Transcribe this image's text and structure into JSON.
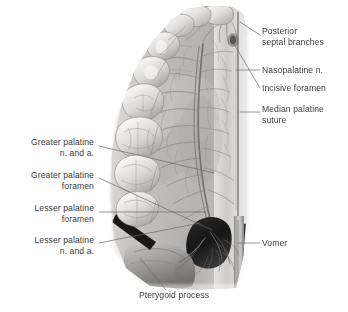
{
  "figure": {
    "type": "anatomical-illustration",
    "style": "grayscale-halftone",
    "background_color": "#ffffff",
    "label_color": "#3c3c3c",
    "leader_color": "#5a5a5a"
  },
  "labels": {
    "posterior_septal_branches": "Posterior\nseptal branches",
    "nasopalatine_n": "Nasopalatine n.",
    "incisive_foramen": "Incisive foramen",
    "median_palatine_suture": "Median palatine\nsuture",
    "vomer": "Vomer",
    "greater_palatine_n_and_a": "Greater palatine\nn. and a.",
    "greater_palatine_foramen": "Greater palatine\nforamen",
    "lesser_palatine_foramen": "Lesser palatine\nforamen",
    "lesser_palatine_n_and_a": "Lesser palatine\nn. and a.",
    "pterygoid_process": "Pterygoid process"
  },
  "structures": [
    "incisors",
    "canine",
    "premolars",
    "molars",
    "palatal mucosa",
    "greater palatine neurovascular bundle",
    "lesser palatine neurovascular bundle",
    "median palatine suture",
    "vomer",
    "choanae",
    "pterygoid process"
  ]
}
